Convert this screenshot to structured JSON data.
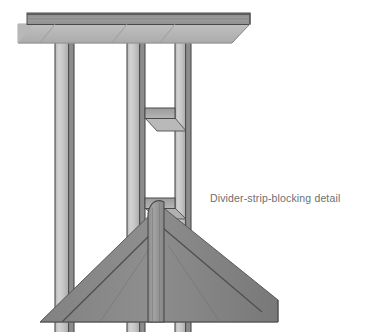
{
  "figure": {
    "title_text": "Divider-strip-blocking detail",
    "type": "architectural-isometric-detail",
    "background": "#ffffff",
    "caption": {
      "text": "Divider-strip-blocking detail",
      "color": "#6e6e6e",
      "x": 210,
      "y": 192,
      "font_size_px": 10.5
    },
    "palette": {
      "beam_top_face": "#8e8e8e",
      "beam_front_face": "#9a9a9a",
      "beam_soffit_face": "#b4b4b4",
      "stud_front_face": "#c9c9c9",
      "stud_side_face": "#8c8c8c",
      "stud_outline": "#4a4a4a",
      "blocking_face": "#b0b0b0",
      "blocking_top_face": "#9d9d9d",
      "hip_face_left": "#8a8a8a",
      "hip_face_right": "#7e7e7e",
      "hip_seam": "#4f4f4f",
      "divider_strip_face": "#9a9a9a",
      "divider_strip_edge": "#4a4a4a",
      "outline": "#3f3f3f"
    },
    "parts": [
      {
        "name": "header-beam",
        "label": "Header beam / top plate",
        "orientation": "horizontal",
        "x1": 18,
        "x2": 250,
        "y_top": 13,
        "y_bottom": 24
      },
      {
        "name": "beam-soffit",
        "label": "Beam soffit (perspective underside)",
        "x1": 18,
        "x2": 250,
        "y_top": 24,
        "y_bottom": 43
      },
      {
        "name": "stud-left",
        "label": "Left stud",
        "x": 55,
        "width": 18,
        "y_top": 24,
        "y_bottom": 332
      },
      {
        "name": "stud-center-left",
        "label": "Center-left divider stud",
        "x": 127,
        "width": 18,
        "y_top": 24,
        "y_bottom": 332
      },
      {
        "name": "stud-center-right",
        "label": "Center-right divider stud",
        "x": 175,
        "width": 16,
        "y_top": 24,
        "y_bottom": 332
      },
      {
        "name": "blocking-upper",
        "label": "Upper divider-strip blocking",
        "x1": 143,
        "x2": 177,
        "y_top": 108,
        "y_bottom": 118
      },
      {
        "name": "blocking-lower",
        "label": "Lower divider-strip blocking",
        "x1": 143,
        "x2": 177,
        "y_top": 198,
        "y_bottom": 208
      },
      {
        "name": "hip-roof-mass",
        "label": "Hip / valley blocking mass",
        "apex_x": 160,
        "apex_y": 205,
        "base_y": 322,
        "x_left": 40,
        "x_right": 278
      },
      {
        "name": "divider-strip",
        "label": "Vertical divider strip",
        "x": 148,
        "width": 16,
        "y_top": 200,
        "y_bottom": 322
      }
    ]
  }
}
